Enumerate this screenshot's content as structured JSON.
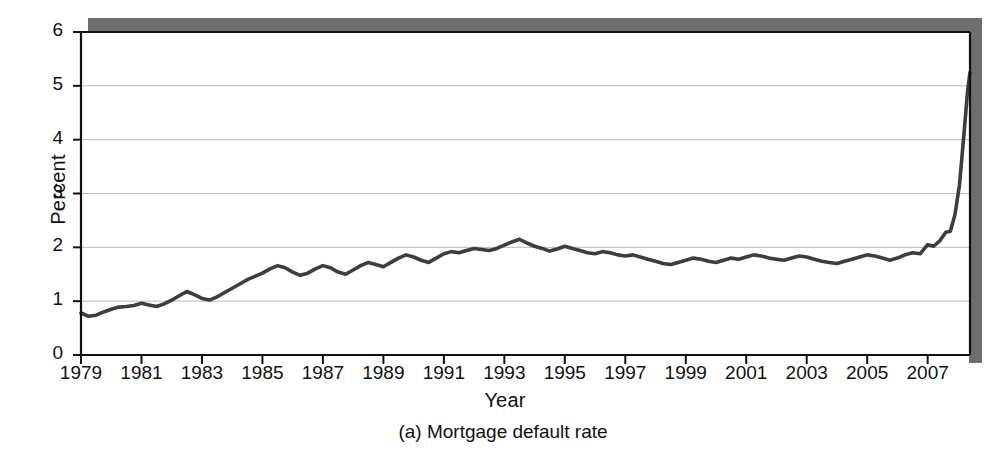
{
  "figure": {
    "caption": "(a) Mortgage default rate",
    "accent_color": "#4a4a4a",
    "line_color": "#3d3d3d",
    "grid_color": "#b9b9b9",
    "axis_color": "#111111",
    "shadow_color": "#6e6e6e",
    "background": "#ffffff"
  },
  "chart_data": {
    "type": "line",
    "title": "",
    "subtitle": "",
    "caption": "(a) Mortgage default rate",
    "xlabel": "Year",
    "ylabel": "Percent",
    "xlim": [
      1979.0,
      2008.4
    ],
    "ylim": [
      0,
      6
    ],
    "yticks": [
      0,
      1,
      2,
      3,
      4,
      5,
      6
    ],
    "ytick_labels": [
      "0",
      "1",
      "2",
      "3",
      "4",
      "5",
      "6"
    ],
    "xticks": [
      1979,
      1981,
      1983,
      1985,
      1987,
      1989,
      1991,
      1993,
      1995,
      1997,
      1999,
      2001,
      2003,
      2005,
      2007
    ],
    "xtick_labels": [
      "1979",
      "1981",
      "1983",
      "1985",
      "1987",
      "1989",
      "1991",
      "1993",
      "1995",
      "1997",
      "1999",
      "2001",
      "2003",
      "2005",
      "2007"
    ],
    "grid": "horizontal",
    "gridlines_at": [
      1,
      2,
      3,
      4,
      5
    ],
    "legend": "none",
    "legend_position": "none",
    "units": "percent",
    "frequency": "quarterly",
    "series": [
      {
        "name": "Mortgage default rate",
        "color": "#3d3d3d",
        "x": [
          1979.0,
          1979.25,
          1979.5,
          1979.75,
          1980.0,
          1980.25,
          1980.5,
          1980.75,
          1981.0,
          1981.25,
          1981.5,
          1981.75,
          1982.0,
          1982.25,
          1982.5,
          1982.75,
          1983.0,
          1983.25,
          1983.5,
          1983.75,
          1984.0,
          1984.25,
          1984.5,
          1984.75,
          1985.0,
          1985.25,
          1985.5,
          1985.75,
          1986.0,
          1986.25,
          1986.5,
          1986.75,
          1987.0,
          1987.25,
          1987.5,
          1987.75,
          1988.0,
          1988.25,
          1988.5,
          1988.75,
          1989.0,
          1989.25,
          1989.5,
          1989.75,
          1990.0,
          1990.25,
          1990.5,
          1990.75,
          1991.0,
          1991.25,
          1991.5,
          1991.75,
          1992.0,
          1992.25,
          1992.5,
          1992.75,
          1993.0,
          1993.25,
          1993.5,
          1993.75,
          1994.0,
          1994.25,
          1994.5,
          1994.75,
          1995.0,
          1995.25,
          1995.5,
          1995.75,
          1996.0,
          1996.25,
          1996.5,
          1996.75,
          1997.0,
          1997.25,
          1997.5,
          1997.75,
          1998.0,
          1998.25,
          1998.5,
          1998.75,
          1999.0,
          1999.25,
          1999.5,
          1999.75,
          2000.0,
          2000.25,
          2000.5,
          2000.75,
          2001.0,
          2001.25,
          2001.5,
          2001.75,
          2002.0,
          2002.25,
          2002.5,
          2002.75,
          2003.0,
          2003.25,
          2003.5,
          2003.75,
          2004.0,
          2004.25,
          2004.5,
          2004.75,
          2005.0,
          2005.25,
          2005.5,
          2005.75,
          2006.0,
          2006.25,
          2006.5,
          2006.75,
          2007.0,
          2007.25,
          2007.5,
          2007.75,
          2008.0,
          2008.4
        ],
        "y": [
          0.78,
          0.72,
          0.75,
          0.8,
          0.86,
          0.92,
          0.95,
          0.97,
          0.97,
          0.93,
          0.98,
          1.05,
          1.12,
          1.2,
          1.15,
          1.22,
          1.18,
          1.1,
          1.04,
          1.12,
          1.22,
          1.3,
          1.37,
          1.45,
          1.52,
          1.62,
          1.66,
          1.63,
          1.5,
          1.48,
          1.58,
          1.64,
          1.62,
          1.53,
          1.48,
          1.57,
          1.66,
          1.74,
          1.72,
          1.8,
          1.86,
          1.78,
          1.72,
          1.8,
          1.88,
          1.94,
          1.93,
          1.96,
          1.99,
          1.96,
          2.0,
          2.08,
          2.15,
          2.08,
          1.99,
          1.92,
          2.0,
          2.06,
          1.98,
          1.94,
          1.92,
          1.94,
          1.9,
          1.88,
          1.86,
          1.84,
          1.86,
          1.82,
          1.78,
          1.72,
          1.68,
          1.66,
          1.7,
          1.74,
          1.72,
          1.7,
          1.74,
          1.78,
          1.73,
          1.7,
          1.72,
          1.76,
          1.8,
          1.84,
          1.86,
          1.84,
          1.82,
          1.84,
          1.86,
          1.82,
          1.78,
          1.74,
          1.72,
          1.76,
          1.8,
          1.78,
          1.76,
          1.8,
          1.84,
          1.8,
          1.78,
          1.76,
          1.8,
          1.84,
          1.82,
          1.8,
          1.78,
          1.82,
          1.86,
          1.84,
          1.8,
          1.76,
          1.74,
          1.72,
          1.8,
          1.88,
          1.84,
          1.8
        ]
      }
    ],
    "annotations": [],
    "notes": {
      "start_value": 0.78,
      "end_value": 5.25,
      "peak_1987": 2.15,
      "peak_2002": 2.5,
      "trough_2000": 1.68,
      "trough_2005": 1.95
    },
    "x_full": [
      1979.0,
      1979.25,
      1979.5,
      1979.75,
      1980.0,
      1980.25,
      1980.5,
      1980.75,
      1981.0,
      1981.25,
      1981.5,
      1981.75,
      1982.0,
      1982.25,
      1982.5,
      1982.75,
      1983.0,
      1983.25,
      1983.5,
      1983.75,
      1984.0,
      1984.25,
      1984.5,
      1984.75,
      1985.0,
      1985.25,
      1985.5,
      1985.75,
      1986.0,
      1986.25,
      1986.5,
      1986.75,
      1987.0,
      1987.25,
      1987.5,
      1987.75,
      1988.0,
      1988.25,
      1988.5,
      1988.75,
      1989.0,
      1989.25,
      1989.5,
      1989.75,
      1990.0,
      1990.25,
      1990.5,
      1990.75,
      1991.0,
      1991.25,
      1991.5,
      1991.75,
      1992.0,
      1992.25,
      1992.5,
      1992.75,
      1993.0,
      1993.25,
      1993.5,
      1993.75,
      1994.0,
      1994.25,
      1994.5,
      1994.75,
      1995.0,
      1995.25,
      1995.5,
      1995.75,
      1996.0,
      1996.25,
      1996.5,
      1996.75,
      1997.0,
      1997.25,
      1997.5,
      1997.75,
      1998.0,
      1998.25,
      1998.5,
      1998.75,
      1999.0,
      1999.25,
      1999.5,
      1999.75,
      2000.0,
      2000.25,
      2000.5,
      2000.75,
      2001.0,
      2001.25,
      2001.5,
      2001.75,
      2002.0,
      2002.25,
      2002.5,
      2002.75,
      2003.0,
      2003.25,
      2003.5,
      2003.75,
      2004.0,
      2004.25,
      2004.5,
      2004.75,
      2005.0,
      2005.25,
      2005.5,
      2005.75,
      2006.0,
      2006.25,
      2006.5,
      2006.75,
      2007.0,
      2007.25,
      2007.5,
      2007.75,
      2008.0,
      2008.4
    ],
    "y_full": [
      0.78,
      0.72,
      0.74,
      0.8,
      0.85,
      0.89,
      0.9,
      0.92,
      0.96,
      0.93,
      0.9,
      0.95,
      1.02,
      1.1,
      1.18,
      1.12,
      1.05,
      1.02,
      1.08,
      1.16,
      1.24,
      1.32,
      1.4,
      1.46,
      1.52,
      1.6,
      1.66,
      1.62,
      1.54,
      1.48,
      1.52,
      1.6,
      1.66,
      1.62,
      1.54,
      1.5,
      1.58,
      1.66,
      1.72,
      1.68,
      1.64,
      1.72,
      1.8,
      1.86,
      1.82,
      1.76,
      1.72,
      1.8,
      1.88,
      1.92,
      1.9,
      1.94,
      1.98,
      1.96,
      1.94,
      1.98,
      2.04,
      2.1,
      2.15,
      2.08,
      2.02,
      1.98,
      1.93,
      1.97,
      2.02,
      1.98,
      1.94,
      1.9,
      1.88,
      1.92,
      1.9,
      1.86,
      1.84,
      1.86,
      1.82,
      1.78,
      1.74,
      1.7,
      1.68,
      1.72,
      1.76,
      1.8,
      1.78,
      1.74,
      1.72,
      1.76,
      1.8,
      1.78,
      1.82,
      1.86,
      1.84,
      1.8,
      1.78,
      1.76,
      1.8,
      1.84,
      1.82,
      1.78,
      1.74,
      1.72,
      1.7,
      1.74,
      1.78,
      1.82,
      1.86,
      1.84,
      1.8,
      1.76,
      1.8,
      1.86,
      1.9,
      1.88,
      1.84,
      1.8,
      1.78,
      1.82,
      1.88,
      1.84
    ]
  }
}
